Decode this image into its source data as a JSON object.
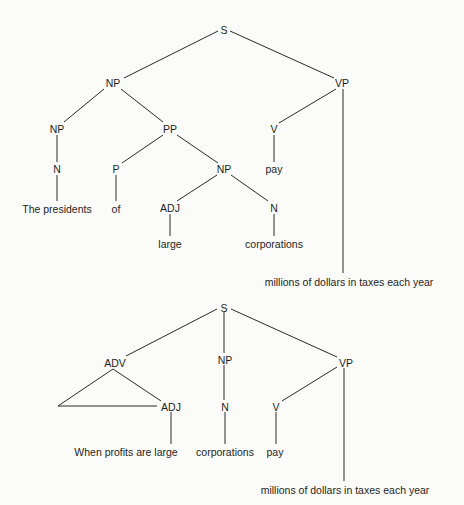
{
  "trees": [
    {
      "id": "tree-1",
      "description": "The presidents of large corporations pay millions of dollars in taxes each year",
      "nodes": [
        {
          "id": "S",
          "label": "S",
          "x": 224,
          "y": 30,
          "kind": "category"
        },
        {
          "id": "NP1",
          "label": "NP",
          "x": 113,
          "y": 83,
          "kind": "category"
        },
        {
          "id": "VP",
          "label": "VP",
          "x": 342,
          "y": 83,
          "kind": "category"
        },
        {
          "id": "NP2",
          "label": "NP",
          "x": 57,
          "y": 129,
          "kind": "category"
        },
        {
          "id": "PP",
          "label": "PP",
          "x": 170,
          "y": 129,
          "kind": "category"
        },
        {
          "id": "V",
          "label": "V",
          "x": 274,
          "y": 129,
          "kind": "category"
        },
        {
          "id": "N1",
          "label": "N",
          "x": 57,
          "y": 169,
          "kind": "category"
        },
        {
          "id": "P",
          "label": "P",
          "x": 116,
          "y": 169,
          "kind": "category"
        },
        {
          "id": "NP3",
          "label": "NP",
          "x": 224,
          "y": 169,
          "kind": "category"
        },
        {
          "id": "pay",
          "label": "pay",
          "x": 274,
          "y": 169,
          "kind": "word"
        },
        {
          "id": "presidents",
          "label": "The presidents",
          "x": 57,
          "y": 209,
          "kind": "word"
        },
        {
          "id": "of",
          "label": "of",
          "x": 116,
          "y": 209,
          "kind": "word"
        },
        {
          "id": "ADJ",
          "label": "ADJ",
          "x": 170,
          "y": 208,
          "kind": "category"
        },
        {
          "id": "N2",
          "label": "N",
          "x": 274,
          "y": 208,
          "kind": "category"
        },
        {
          "id": "large",
          "label": "large",
          "x": 170,
          "y": 244,
          "kind": "word"
        },
        {
          "id": "corporations",
          "label": "corporations",
          "x": 274,
          "y": 244,
          "kind": "word"
        },
        {
          "id": "object",
          "label": "millions of dollars in taxes each year",
          "x": 349,
          "y": 282,
          "kind": "word"
        }
      ],
      "edges": [
        {
          "from": [
            218,
            31
          ],
          "to": [
            124,
            78
          ]
        },
        {
          "from": [
            230,
            31
          ],
          "to": [
            334,
            78
          ]
        },
        {
          "from": [
            104,
            89
          ],
          "to": [
            64,
            122
          ]
        },
        {
          "from": [
            121,
            89
          ],
          "to": [
            163,
            122
          ]
        },
        {
          "from": [
            336,
            89
          ],
          "to": [
            279,
            123
          ]
        },
        {
          "from": [
            343,
            89
          ],
          "to": [
            343,
            273
          ]
        },
        {
          "from": [
            57,
            135
          ],
          "to": [
            57,
            162
          ]
        },
        {
          "from": [
            163,
            135
          ],
          "to": [
            122,
            163
          ]
        },
        {
          "from": [
            177,
            135
          ],
          "to": [
            218,
            163
          ]
        },
        {
          "from": [
            274,
            135
          ],
          "to": [
            274,
            162
          ]
        },
        {
          "from": [
            57,
            175
          ],
          "to": [
            57,
            201
          ]
        },
        {
          "from": [
            116,
            175
          ],
          "to": [
            116,
            201
          ]
        },
        {
          "from": [
            217,
            175
          ],
          "to": [
            177,
            201
          ]
        },
        {
          "from": [
            231,
            175
          ],
          "to": [
            268,
            201
          ]
        },
        {
          "from": [
            170,
            214
          ],
          "to": [
            170,
            236
          ]
        },
        {
          "from": [
            274,
            214
          ],
          "to": [
            274,
            236
          ]
        }
      ]
    },
    {
      "id": "tree-2",
      "description": "When profits are large corporations pay millions of dollars in taxes each year",
      "nodes": [
        {
          "id": "S",
          "label": "S",
          "x": 224,
          "y": 308,
          "kind": "category"
        },
        {
          "id": "ADV",
          "label": "ADV",
          "x": 115,
          "y": 363,
          "kind": "category"
        },
        {
          "id": "NP",
          "label": "NP",
          "x": 225,
          "y": 360,
          "kind": "category"
        },
        {
          "id": "VP",
          "label": "VP",
          "x": 346,
          "y": 363,
          "kind": "category"
        },
        {
          "id": "ADJ",
          "label": "ADJ",
          "x": 171,
          "y": 407,
          "kind": "category"
        },
        {
          "id": "N",
          "label": "N",
          "x": 225,
          "y": 407,
          "kind": "category"
        },
        {
          "id": "V",
          "label": "V",
          "x": 276,
          "y": 407,
          "kind": "category"
        },
        {
          "id": "clause",
          "label": "When profits are large",
          "x": 126,
          "y": 452,
          "kind": "word"
        },
        {
          "id": "corporations",
          "label": "corporations",
          "x": 225,
          "y": 452,
          "kind": "word"
        },
        {
          "id": "pay",
          "label": "pay",
          "x": 275,
          "y": 452,
          "kind": "word"
        },
        {
          "id": "object",
          "label": "millions of dollars in taxes each year",
          "x": 345,
          "y": 490,
          "kind": "word"
        }
      ],
      "edges": [
        {
          "from": [
            217,
            309
          ],
          "to": [
            126,
            356
          ]
        },
        {
          "from": [
            224,
            312
          ],
          "to": [
            224,
            353
          ]
        },
        {
          "from": [
            231,
            309
          ],
          "to": [
            337,
            357
          ]
        },
        {
          "from": [
            113,
            369
          ],
          "to": [
            58,
            406
          ]
        },
        {
          "from": [
            58,
            406
          ],
          "to": [
            157,
            406
          ]
        },
        {
          "from": [
            113,
            369
          ],
          "to": [
            161,
            401
          ]
        },
        {
          "from": [
            224,
            365
          ],
          "to": [
            224,
            400
          ]
        },
        {
          "from": [
            337,
            367
          ],
          "to": [
            282,
            401
          ]
        },
        {
          "from": [
            344,
            368
          ],
          "to": [
            344,
            481
          ]
        },
        {
          "from": [
            171,
            412
          ],
          "to": [
            171,
            444
          ]
        },
        {
          "from": [
            225,
            412
          ],
          "to": [
            225,
            444
          ]
        },
        {
          "from": [
            276,
            412
          ],
          "to": [
            276,
            444
          ]
        }
      ],
      "triangle": {
        "apex_node": "ADV",
        "note": "roof notation over ADV constituent"
      }
    }
  ],
  "colors": {
    "background": "#fbfbf9",
    "ink": "#1e1e1e",
    "lines": "#2a2a2a"
  }
}
